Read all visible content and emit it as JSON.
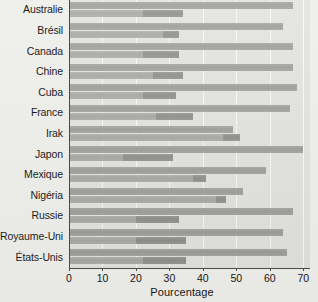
{
  "chart_data": {
    "type": "bar",
    "orientation": "horizontal",
    "title": "",
    "xlabel": "Pourcentage",
    "ylabel": "",
    "xlim": [
      0,
      72
    ],
    "xticks": [
      0,
      10,
      20,
      30,
      40,
      50,
      60,
      70
    ],
    "xticklabels": [
      "0",
      "10",
      "20",
      "30",
      "40",
      "50",
      "60",
      "70"
    ],
    "grid": true,
    "grid_axis": "x",
    "legend": null,
    "categories": [
      "Australie",
      "Brésil",
      "Canada",
      "Chine",
      "Cuba",
      "France",
      "Irak",
      "Japon",
      "Mexique",
      "Nigéria",
      "Russie",
      "Royaume-Uni",
      "États-Unis"
    ],
    "series": [
      {
        "name": "serie-1",
        "values": [
          67,
          64,
          67,
          67,
          68,
          66,
          49,
          70,
          59,
          52,
          67,
          64,
          65
        ]
      },
      {
        "name": "serie-2",
        "values": [
          34,
          33,
          33,
          34,
          32,
          37,
          51,
          31,
          41,
          47,
          33,
          35,
          35
        ]
      }
    ],
    "series2_segment_start": [
      22,
      28,
      22,
      25,
      22,
      26,
      46,
      16,
      37,
      44,
      20,
      20,
      22
    ],
    "colors": {
      "series1": "#9d9d99",
      "series2": "#a7a7a3",
      "series2_segment": "#8e8e8a",
      "plot_background": "#e4e4e1",
      "page_background": "#ecece9",
      "gridline": "#fbfbfa",
      "axis": "#4a4a48",
      "text": "#141414"
    }
  }
}
